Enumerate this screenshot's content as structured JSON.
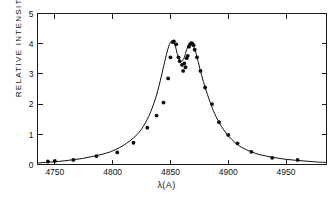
{
  "figure": {
    "background_color": "#ffffff",
    "ink_color": "#111111"
  },
  "axes": {
    "x_title": "λ(A)",
    "y_title": "RELATIVE  INTENSITY",
    "x_ticks": [
      "4750",
      "4800",
      "4850",
      "4900",
      "4950"
    ],
    "y_ticks": [
      "0",
      "1",
      "2",
      "3",
      "4",
      "5"
    ]
  },
  "chart_data": {
    "type": "scatter",
    "title": "",
    "xlabel": "λ(A)",
    "ylabel": "RELATIVE  INTENSITY",
    "xlim": [
      4735,
      4985
    ],
    "ylim": [
      0,
      5
    ],
    "xticks": [
      4750,
      4800,
      4850,
      4900,
      4950
    ],
    "yticks": [
      0,
      1,
      2,
      3,
      4,
      5
    ],
    "grid": false,
    "legend": null,
    "series": [
      {
        "name": "fitted profile",
        "type": "line",
        "x": [
          4735,
          4742,
          4750,
          4758,
          4766,
          4774,
          4782,
          4790,
          4798,
          4806,
          4812,
          4818,
          4824,
          4830,
          4834,
          4838,
          4842,
          4845,
          4848,
          4850,
          4852,
          4854,
          4856,
          4858,
          4860,
          4862,
          4864,
          4866,
          4868,
          4870,
          4872,
          4874,
          4877,
          4880,
          4884,
          4888,
          4892,
          4896,
          4900,
          4906,
          4912,
          4920,
          4928,
          4938,
          4948,
          4958,
          4968,
          4978,
          4985
        ],
        "y": [
          0.05,
          0.07,
          0.09,
          0.12,
          0.16,
          0.2,
          0.26,
          0.33,
          0.42,
          0.56,
          0.7,
          0.88,
          1.12,
          1.5,
          1.85,
          2.3,
          2.9,
          3.4,
          3.85,
          4.05,
          4.08,
          3.95,
          3.65,
          3.45,
          3.42,
          3.55,
          3.8,
          3.97,
          4.0,
          3.92,
          3.7,
          3.4,
          2.95,
          2.55,
          2.1,
          1.7,
          1.4,
          1.15,
          0.95,
          0.72,
          0.56,
          0.42,
          0.32,
          0.24,
          0.18,
          0.14,
          0.11,
          0.08,
          0.07
        ]
      },
      {
        "name": "measured points",
        "type": "scatter",
        "x": [
          4744,
          4750,
          4766,
          4786,
          4804,
          4818,
          4830,
          4838,
          4844,
          4848,
          4850,
          4852,
          4853,
          4855,
          4857,
          4858,
          4860,
          4861,
          4862,
          4863,
          4864,
          4865,
          4866,
          4867,
          4868,
          4869,
          4870,
          4871,
          4873,
          4876,
          4880,
          4886,
          4892,
          4900,
          4908,
          4920,
          4938,
          4960
        ],
        "y": [
          0.1,
          0.12,
          0.15,
          0.28,
          0.4,
          0.72,
          1.22,
          1.62,
          2.05,
          2.85,
          3.55,
          4.05,
          4.08,
          3.98,
          3.55,
          3.42,
          3.3,
          3.1,
          3.35,
          3.22,
          3.52,
          3.6,
          3.9,
          3.98,
          4.02,
          4.0,
          3.95,
          3.8,
          3.55,
          3.1,
          2.55,
          2.0,
          1.4,
          0.98,
          0.7,
          0.42,
          0.22,
          0.15
        ]
      }
    ]
  }
}
